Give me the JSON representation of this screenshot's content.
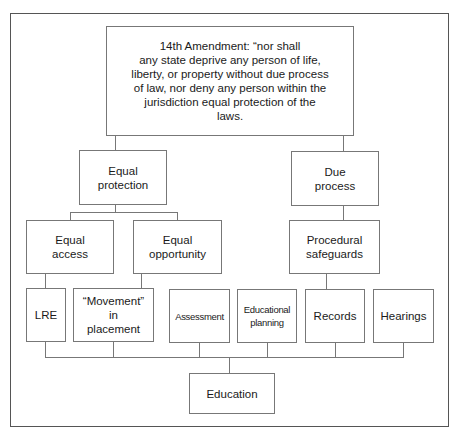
{
  "diagram": {
    "root": {
      "text": "14th Amendment: “nor shall\nany state deprive any person of life,\nliberty, or property without due process\nof law, nor deny any person within the\njurisdiction equal protection of the\nlaws."
    },
    "level1": [
      {
        "id": "equal-protection",
        "label": "Equal\nprotection"
      },
      {
        "id": "due-process",
        "label": "Due\nprocess"
      }
    ],
    "level2": [
      {
        "id": "equal-access",
        "label": "Equal\naccess",
        "parent": "equal-protection"
      },
      {
        "id": "equal-opportunity",
        "label": "Equal\nopportunity",
        "parent": "equal-protection"
      },
      {
        "id": "procedural-safeguards",
        "label": "Procedural\nsafeguards",
        "parent": "due-process"
      }
    ],
    "level3": [
      {
        "id": "lre",
        "label": "LRE",
        "parent": "equal-access"
      },
      {
        "id": "movement",
        "label": "“Movement”\nin\nplacement",
        "parent": "equal-opportunity"
      },
      {
        "id": "assessment",
        "label": "Assessment",
        "parent": ""
      },
      {
        "id": "educational-planning",
        "label": "Educational\nplanning",
        "parent": ""
      },
      {
        "id": "records",
        "label": "Records",
        "parent": "procedural-safeguards"
      },
      {
        "id": "hearings",
        "label": "Hearings",
        "parent": ""
      }
    ],
    "sink": {
      "id": "education",
      "label": "Education"
    }
  }
}
